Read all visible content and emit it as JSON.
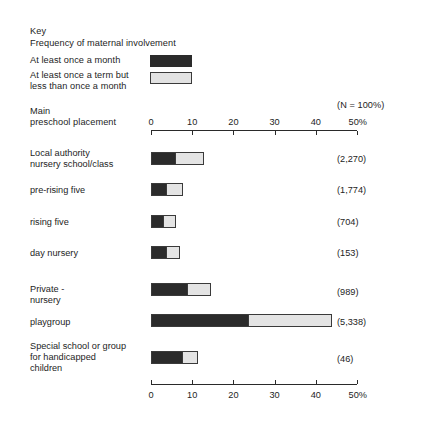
{
  "key": {
    "title": "Key",
    "subtitle": "Frequency of maternal involvement",
    "dark_label": "At least once a month",
    "light_label": "At least once a term but\nless than once a month",
    "dark_color": "#2b2b2b",
    "light_color": "#e4e4e4"
  },
  "header": {
    "row_heading": "Main\npreschool placement",
    "n_heading": "(N = 100%)"
  },
  "axis": {
    "ticks": [
      "0",
      "10",
      "20",
      "30",
      "40",
      "50%"
    ],
    "tick_values": [
      0,
      10,
      20,
      30,
      40,
      50
    ],
    "min": 0,
    "max": 50
  },
  "chart_data": {
    "type": "bar",
    "xlabel": "",
    "ylabel": "Main preschool placement",
    "xlim": [
      0,
      50
    ],
    "grid": false,
    "legend_position": "top-left",
    "orientation": "horizontal",
    "stacked": true,
    "unit": "%",
    "categories": [
      "Local authority\nnursery school/class",
      "pre-rising five",
      "rising five",
      "day nursery",
      "Private -\nnursery",
      "playgroup",
      "Special school or group\nfor handicapped\nchildren"
    ],
    "series": [
      {
        "name": "At least once a month",
        "color": "#2b2b2b",
        "values": [
          5.6,
          3.4,
          2.9,
          3.6,
          8.7,
          23.5,
          7.5
        ]
      },
      {
        "name": "At least once a term but less than once a month",
        "color": "#e4e4e4",
        "values": [
          6.8,
          3.9,
          2.7,
          2.9,
          5.4,
          19.9,
          3.5
        ]
      }
    ],
    "n_values": [
      "(2,270)",
      "(1,774)",
      "(704)",
      "(153)",
      "(989)",
      "(5,338)",
      "(46)"
    ],
    "n_numbers": [
      2270,
      1774,
      704,
      153,
      989,
      5338,
      46
    ]
  },
  "rows": [
    {
      "label": "Local authority\nnursery school/class",
      "dark": 5.6,
      "light": 6.8,
      "n": "(2,270)",
      "label_top": 148,
      "bar_top": 152,
      "n_top": 154
    },
    {
      "label": "pre-rising five",
      "dark": 3.4,
      "light": 3.9,
      "n": "(1,774)",
      "label_top": 185,
      "bar_top": 183,
      "n_top": 185
    },
    {
      "label": "rising five",
      "dark": 2.9,
      "light": 2.7,
      "n": "(704)",
      "label_top": 217,
      "bar_top": 215,
      "n_top": 217
    },
    {
      "label": "day nursery",
      "dark": 3.6,
      "light": 2.9,
      "n": "(153)",
      "label_top": 248,
      "bar_top": 246,
      "n_top": 248
    },
    {
      "label": "Private -\nnursery",
      "dark": 8.7,
      "light": 5.4,
      "n": "(989)",
      "label_top": 284,
      "bar_top": 283,
      "n_top": 287
    },
    {
      "label": "playgroup",
      "dark": 23.5,
      "light": 19.9,
      "n": "(5,338)",
      "label_top": 317,
      "bar_top": 314,
      "n_top": 317
    },
    {
      "label": "Special school or group\nfor handicapped\nchildren",
      "dark": 7.5,
      "light": 3.5,
      "n": "(46)",
      "label_top": 341,
      "bar_top": 351,
      "n_top": 354
    }
  ]
}
